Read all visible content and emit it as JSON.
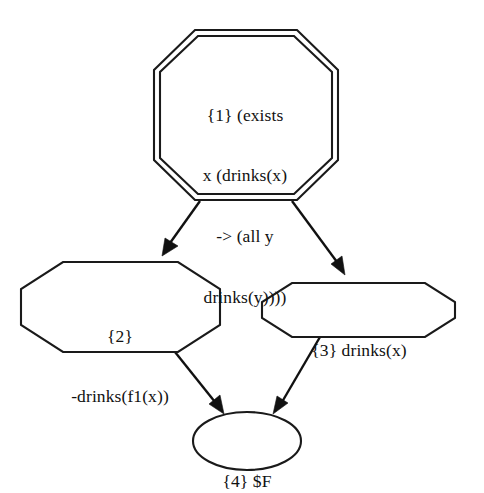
{
  "diagram": {
    "type": "proof-tree",
    "background_color": "#ffffff",
    "line_color": "#111111",
    "nodes": [
      {
        "id": "1",
        "shape": "doubleoctagon",
        "lines": [
          "{1} (exists",
          "x (drinks(x)",
          "-> (all y",
          "drinks(y))))"
        ],
        "text": "{1} (exists x (drinks(x) -> (all y drinks(y))))"
      },
      {
        "id": "2",
        "shape": "octagon",
        "lines": [
          "{2}",
          "-drinks(f1(x))"
        ],
        "text": "{2} -drinks(f1(x))"
      },
      {
        "id": "3",
        "shape": "octagon",
        "lines": [
          "{3} drinks(x)"
        ],
        "text": "{3} drinks(x)"
      },
      {
        "id": "4",
        "shape": "ellipse",
        "lines": [
          "{4} $F"
        ],
        "text": "{4} $F"
      }
    ],
    "edges": [
      {
        "from": "1",
        "to": "2",
        "arrowhead": "filled"
      },
      {
        "from": "1",
        "to": "3",
        "arrowhead": "filled"
      },
      {
        "from": "2",
        "to": "4",
        "arrowhead": "filled"
      },
      {
        "from": "3",
        "to": "4",
        "arrowhead": "filled"
      }
    ]
  }
}
